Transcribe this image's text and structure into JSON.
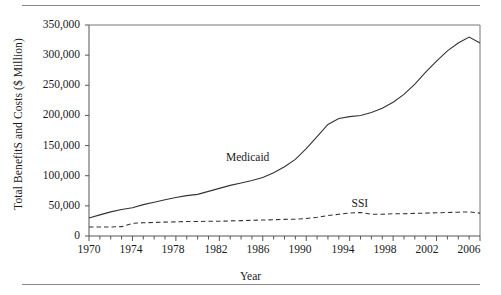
{
  "chart_data": {
    "type": "line",
    "title": "",
    "xlabel": "Year",
    "ylabel": "Total BenefitS and Costs ($ Million)",
    "xlim": [
      1970,
      2006
    ],
    "ylim": [
      0,
      350000
    ],
    "grid": false,
    "legend_position": "inline-annotation",
    "x": [
      1970,
      1971,
      1972,
      1973,
      1974,
      1975,
      1976,
      1977,
      1978,
      1979,
      1980,
      1981,
      1982,
      1983,
      1984,
      1985,
      1986,
      1987,
      1988,
      1989,
      1990,
      1991,
      1992,
      1993,
      1994,
      1995,
      1996,
      1997,
      1998,
      1999,
      2000,
      2001,
      2002,
      2003,
      2004,
      2005,
      2006
    ],
    "xticks": [
      1970,
      1974,
      1978,
      1982,
      1986,
      1990,
      1994,
      1998,
      2002,
      2006
    ],
    "xticks_labels": [
      "1970",
      "1974",
      "1978",
      "1982",
      "1986",
      "1990",
      "1994",
      "1998",
      "2002",
      "2006"
    ],
    "xminor_tick_interval": 1,
    "yticks": [
      0,
      50000,
      100000,
      150000,
      200000,
      250000,
      300000,
      350000
    ],
    "yticks_labels": [
      "0",
      "50,000",
      "100,000",
      "150,000",
      "200,000",
      "250,000",
      "300,000",
      "350,000"
    ],
    "series": [
      {
        "name": "Medicaid",
        "style": "solid",
        "color": "#333333",
        "label_x": 1985,
        "label_y": 128000,
        "values": [
          30000,
          35000,
          40000,
          44000,
          47000,
          52000,
          56000,
          60000,
          64000,
          67000,
          69000,
          74000,
          79000,
          84000,
          88000,
          92000,
          97000,
          105000,
          115000,
          127000,
          145000,
          165000,
          185000,
          195000,
          198000,
          200000,
          205000,
          212000,
          222000,
          235000,
          252000,
          272000,
          290000,
          307000,
          320000,
          330000,
          320000
        ]
      },
      {
        "name": "SSI",
        "style": "dashed",
        "color": "#333333",
        "label_x": 1995,
        "label_y": 52000,
        "values": [
          15000,
          15000,
          15000,
          15500,
          21000,
          22000,
          22500,
          23000,
          23500,
          24000,
          24000,
          24500,
          24500,
          25000,
          25500,
          26000,
          26500,
          27000,
          27500,
          28000,
          29000,
          31000,
          34000,
          36000,
          38000,
          39000,
          36000,
          36000,
          37000,
          37000,
          37500,
          38000,
          38500,
          39000,
          39500,
          40000,
          38000
        ]
      }
    ],
    "annotations": [
      {
        "text": "Medicaid"
      },
      {
        "text": "SSI"
      }
    ]
  }
}
